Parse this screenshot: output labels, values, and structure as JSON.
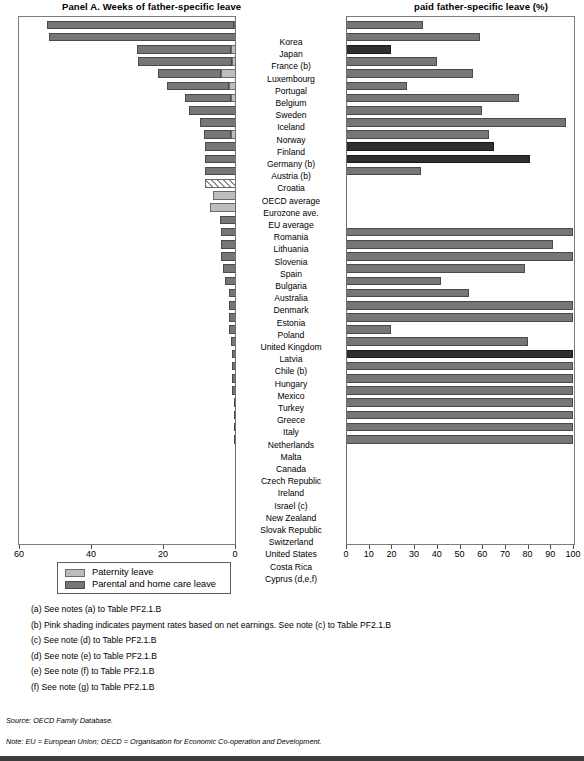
{
  "panels": {
    "left_title": "Panel A. Weeks of father-specific leave",
    "right_title": "paid father-specific leave (%)"
  },
  "legend": {
    "items": [
      {
        "key": "paternity",
        "label": "Paternity leave",
        "color": "#bdbdbd"
      },
      {
        "key": "parental",
        "label": "Parental and home care leave",
        "color": "#767676"
      }
    ]
  },
  "axes": {
    "left_ticks": [
      "60",
      "40",
      "20",
      "0"
    ],
    "right_ticks": [
      "0",
      "10",
      "20",
      "30",
      "40",
      "50",
      "60",
      "70",
      "80",
      "90",
      "100"
    ]
  },
  "notes": [
    "(a) See notes (a) to Table PF2.1.B",
    "(b) Pink shading indicates payment rates based on net earnings. See note (c) to Table PF2.1.B",
    "(c) See note (d) to Table PF2.1.B",
    "(d) See note (e) to Table PF2.1.B",
    "(e) See note (f) to Table PF2.1.B",
    "(f) See note (g) to Table PF2.1.B"
  ],
  "source": "Source: OECD Family Database.",
  "note_line": "Note: EU = European Union; OECD = Organisation for Economic Co-operation and Development.",
  "chart_data": {
    "type": "bar",
    "orientation": "horizontal",
    "panels": [
      {
        "name": "left",
        "title": "Panel A. Weeks of father-specific leave",
        "xlabel": "Weeks",
        "xlim": [
          0,
          60
        ],
        "reversed": true,
        "ticks": [
          60,
          40,
          20,
          0
        ],
        "series": [
          {
            "name": "Paternity leave",
            "color": "#bdbdbd"
          },
          {
            "name": "Parental and home care leave",
            "color": "#767676"
          }
        ]
      },
      {
        "name": "right",
        "title": "paid father-specific leave (%)",
        "xlabel": "%",
        "xlim": [
          0,
          100
        ],
        "ticks": [
          0,
          10,
          20,
          30,
          40,
          50,
          60,
          70,
          80,
          90,
          100
        ],
        "series": [
          {
            "name": "Average payment rate across paid father-specific leave",
            "color": "#767676"
          }
        ]
      }
    ],
    "categories": [
      "Korea",
      "Japan",
      "France (b)",
      "Luxembourg",
      "Portugal",
      "Belgium",
      "Sweden",
      "Iceland",
      "Norway",
      "Finland",
      "Germany (b)",
      "Austria (b)",
      "Croatia",
      "OECD average",
      "Eurozone ave.",
      "EU average",
      "Romania",
      "Lithuania",
      "Slovenia",
      "Spain",
      "Bulgaria",
      "Australia",
      "Denmark",
      "Estonia",
      "Poland",
      "United Kingdom",
      "Latvia",
      "Chile (b)",
      "Hungary",
      "Mexico",
      "Turkey",
      "Greece",
      "Italy",
      "Netherlands",
      "Malta",
      "Canada",
      "Czech Republic",
      "Ireland",
      "Israel (c)",
      "New Zealand",
      "Slovak Republic",
      "Switzerland",
      "United States",
      "Costa Rica",
      "Cyprus (d,e,f)"
    ],
    "rows": [
      {
        "country": "Korea",
        "paternity": 0.6,
        "parental": 52.0,
        "weeks_total": 52.6,
        "paid_pct": 34,
        "pink": false
      },
      {
        "country": "Japan",
        "paternity": 0.0,
        "parental": 52.0,
        "weeks_total": 52.0,
        "paid_pct": 59,
        "pink": false
      },
      {
        "country": "France (b)",
        "paternity": 1.4,
        "parental": 26.0,
        "weeks_total": 27.4,
        "paid_pct": 20,
        "pink": true
      },
      {
        "country": "Luxembourg",
        "paternity": 1.2,
        "parental": 26.0,
        "weeks_total": 27.2,
        "paid_pct": 40,
        "pink": false
      },
      {
        "country": "Portugal",
        "paternity": 4.3,
        "parental": 17.3,
        "weeks_total": 21.6,
        "paid_pct": 56,
        "pink": false
      },
      {
        "country": "Belgium",
        "paternity": 2.0,
        "parental": 17.3,
        "weeks_total": 19.3,
        "paid_pct": 27,
        "pink": false
      },
      {
        "country": "Sweden",
        "paternity": 1.4,
        "parental": 12.9,
        "weeks_total": 14.3,
        "paid_pct": 76,
        "pink": false
      },
      {
        "country": "Iceland",
        "paternity": 0.0,
        "parental": 13.0,
        "weeks_total": 13.0,
        "paid_pct": 60,
        "pink": false
      },
      {
        "country": "Norway",
        "paternity": 0.0,
        "parental": 10.0,
        "weeks_total": 10.0,
        "paid_pct": 97,
        "pink": false
      },
      {
        "country": "Finland",
        "paternity": 1.5,
        "parental": 7.5,
        "weeks_total": 9.0,
        "paid_pct": 63,
        "pink": false
      },
      {
        "country": "Germany (b)",
        "paternity": 0.0,
        "parental": 8.7,
        "weeks_total": 8.7,
        "paid_pct": 65,
        "pink": true
      },
      {
        "country": "Austria (b)",
        "paternity": 0.0,
        "parental": 8.7,
        "weeks_total": 8.7,
        "paid_pct": 81,
        "pink": true
      },
      {
        "country": "Croatia",
        "paternity": 0.0,
        "parental": 8.7,
        "weeks_total": 8.7,
        "paid_pct": 33,
        "pink": false
      },
      {
        "country": "OECD average",
        "paternity": 0.0,
        "parental": 8.5,
        "weeks_total": 8.5,
        "paid_pct": 0,
        "pink": false,
        "hatched": true
      },
      {
        "country": "Eurozone ave.",
        "paternity": 6.5,
        "parental": 0.0,
        "weeks_total": 6.5,
        "paid_pct": 0,
        "pink": false
      },
      {
        "country": "EU average",
        "paternity": 7.2,
        "parental": 0.0,
        "weeks_total": 7.2,
        "paid_pct": 0,
        "pink": false
      },
      {
        "country": "Romania",
        "paternity": 0.0,
        "parental": 4.5,
        "weeks_total": 4.5,
        "paid_pct": 0,
        "pink": false
      },
      {
        "country": "Lithuania",
        "paternity": 0.0,
        "parental": 4.3,
        "weeks_total": 4.3,
        "paid_pct": 100,
        "pink": false
      },
      {
        "country": "Slovenia",
        "paternity": 0.0,
        "parental": 4.3,
        "weeks_total": 4.3,
        "paid_pct": 91,
        "pink": false
      },
      {
        "country": "Spain",
        "paternity": 0.0,
        "parental": 4.3,
        "weeks_total": 4.3,
        "paid_pct": 100,
        "pink": false
      },
      {
        "country": "Bulgaria",
        "paternity": 0.0,
        "parental": 3.5,
        "weeks_total": 3.5,
        "paid_pct": 79,
        "pink": false
      },
      {
        "country": "Australia",
        "paternity": 0.0,
        "parental": 3.0,
        "weeks_total": 3.0,
        "paid_pct": 42,
        "pink": false
      },
      {
        "country": "Denmark",
        "paternity": 0.0,
        "parental": 2.0,
        "weeks_total": 2.0,
        "paid_pct": 54,
        "pink": false
      },
      {
        "country": "Estonia",
        "paternity": 0.0,
        "parental": 2.0,
        "weeks_total": 2.0,
        "paid_pct": 100,
        "pink": false
      },
      {
        "country": "Poland",
        "paternity": 0.0,
        "parental": 2.0,
        "weeks_total": 2.0,
        "paid_pct": 100,
        "pink": false
      },
      {
        "country": "United Kingdom",
        "paternity": 0.0,
        "parental": 2.0,
        "weeks_total": 2.0,
        "paid_pct": 20,
        "pink": false
      },
      {
        "country": "Latvia",
        "paternity": 0.0,
        "parental": 1.4,
        "weeks_total": 1.4,
        "paid_pct": 80,
        "pink": false
      },
      {
        "country": "Chile (b)",
        "paternity": 0.0,
        "parental": 1.0,
        "weeks_total": 1.0,
        "paid_pct": 100,
        "pink": true
      },
      {
        "country": "Hungary",
        "paternity": 0.0,
        "parental": 1.0,
        "weeks_total": 1.0,
        "paid_pct": 100,
        "pink": false
      },
      {
        "country": "Mexico",
        "paternity": 0.0,
        "parental": 1.0,
        "weeks_total": 1.0,
        "paid_pct": 100,
        "pink": false
      },
      {
        "country": "Turkey",
        "paternity": 0.0,
        "parental": 1.0,
        "weeks_total": 1.0,
        "paid_pct": 100,
        "pink": false
      },
      {
        "country": "Greece",
        "paternity": 0.0,
        "parental": 0.4,
        "weeks_total": 0.4,
        "paid_pct": 100,
        "pink": false
      },
      {
        "country": "Italy",
        "paternity": 0.0,
        "parental": 0.4,
        "weeks_total": 0.4,
        "paid_pct": 100,
        "pink": false
      },
      {
        "country": "Netherlands",
        "paternity": 0.0,
        "parental": 0.4,
        "weeks_total": 0.4,
        "paid_pct": 100,
        "pink": false
      },
      {
        "country": "Malta",
        "paternity": 0.0,
        "parental": 0.2,
        "weeks_total": 0.2,
        "paid_pct": 100,
        "pink": false
      },
      {
        "country": "Canada",
        "paternity": 0.0,
        "parental": 0.0,
        "weeks_total": 0.0,
        "paid_pct": 0,
        "pink": false
      },
      {
        "country": "Czech Republic",
        "paternity": 0.0,
        "parental": 0.0,
        "weeks_total": 0.0,
        "paid_pct": 0,
        "pink": false
      },
      {
        "country": "Ireland",
        "paternity": 0.0,
        "parental": 0.0,
        "weeks_total": 0.0,
        "paid_pct": 0,
        "pink": false
      },
      {
        "country": "Israel (c)",
        "paternity": 0.0,
        "parental": 0.0,
        "weeks_total": 0.0,
        "paid_pct": 0,
        "pink": false
      },
      {
        "country": "New Zealand",
        "paternity": 0.0,
        "parental": 0.0,
        "weeks_total": 0.0,
        "paid_pct": 0,
        "pink": false
      },
      {
        "country": "Slovak Republic",
        "paternity": 0.0,
        "parental": 0.0,
        "weeks_total": 0.0,
        "paid_pct": 0,
        "pink": false
      },
      {
        "country": "Switzerland",
        "paternity": 0.0,
        "parental": 0.0,
        "weeks_total": 0.0,
        "paid_pct": 0,
        "pink": false
      },
      {
        "country": "United States",
        "paternity": 0.0,
        "parental": 0.0,
        "weeks_total": 0.0,
        "paid_pct": 0,
        "pink": false
      },
      {
        "country": "Costa Rica",
        "paternity": 0.0,
        "parental": 0.0,
        "weeks_total": 0.0,
        "paid_pct": 0,
        "pink": false
      },
      {
        "country": "Cyprus (d,e,f)",
        "paternity": 0.0,
        "parental": 0.0,
        "weeks_total": 0.0,
        "paid_pct": 0,
        "pink": false
      }
    ]
  }
}
